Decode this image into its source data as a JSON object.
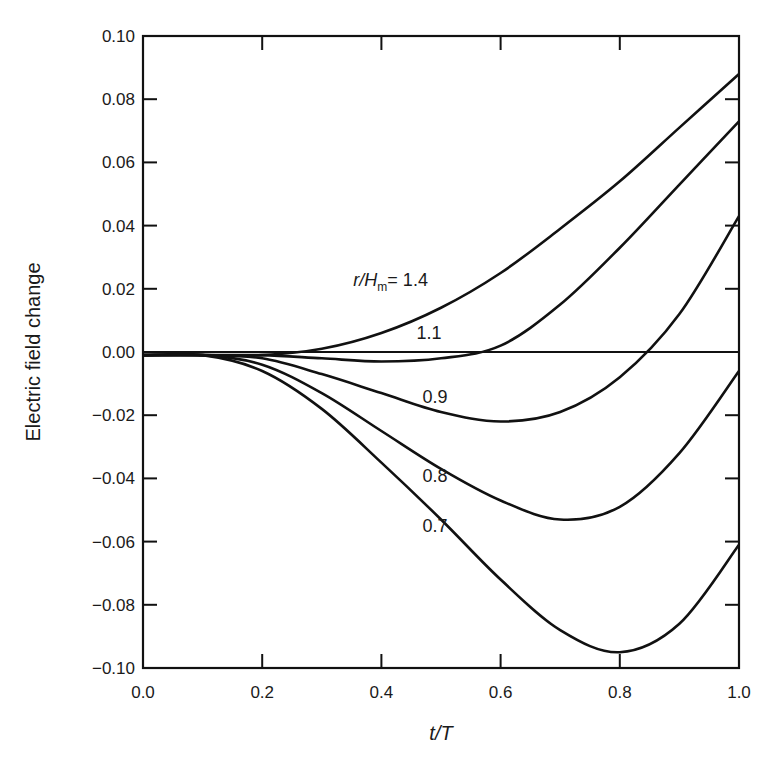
{
  "chart_data": {
    "type": "line",
    "title": "",
    "xlabel": "t/T",
    "ylabel": "Electric field change",
    "xlim": [
      0.0,
      1.0
    ],
    "ylim": [
      -0.1,
      0.1
    ],
    "grid": false,
    "legend_position": "inline curve labels",
    "x_ticks": [
      "0.0",
      "0.2",
      "0.4",
      "0.6",
      "0.8",
      "1.0"
    ],
    "y_ticks": [
      "0.10",
      "0.08",
      "0.06",
      "0.04",
      "0.02",
      "0.00",
      "−0.02",
      "−0.04",
      "−0.06",
      "−0.08",
      "−0.10"
    ],
    "reference_line": {
      "y": 0.0,
      "label": "zero line"
    },
    "label_prefix": "r/H",
    "label_subscript": "m",
    "series": [
      {
        "name": "r/Hm = 1.4",
        "label": "= 1.4",
        "x": [
          0.0,
          0.1,
          0.2,
          0.3,
          0.4,
          0.5,
          0.6,
          0.7,
          0.8,
          0.9,
          1.0
        ],
        "values": [
          -0.001,
          -0.001,
          -0.001,
          0.001,
          0.006,
          0.014,
          0.025,
          0.039,
          0.054,
          0.071,
          0.088
        ]
      },
      {
        "name": "r/Hm = 1.1",
        "label": "1.1",
        "x": [
          0.0,
          0.1,
          0.2,
          0.3,
          0.4,
          0.5,
          0.6,
          0.7,
          0.8,
          0.9,
          1.0
        ],
        "values": [
          -0.001,
          -0.001,
          -0.001,
          -0.002,
          -0.003,
          -0.002,
          0.002,
          0.015,
          0.033,
          0.053,
          0.073
        ]
      },
      {
        "name": "r/Hm = 0.9",
        "label": "0.9",
        "x": [
          0.0,
          0.1,
          0.2,
          0.3,
          0.4,
          0.5,
          0.6,
          0.7,
          0.8,
          0.9,
          1.0
        ],
        "values": [
          -0.001,
          -0.001,
          -0.002,
          -0.007,
          -0.013,
          -0.019,
          -0.022,
          -0.019,
          -0.008,
          0.012,
          0.043
        ]
      },
      {
        "name": "r/Hm = 0.8",
        "label": "0.8",
        "x": [
          0.0,
          0.1,
          0.2,
          0.3,
          0.4,
          0.5,
          0.6,
          0.7,
          0.8,
          0.9,
          1.0
        ],
        "values": [
          -0.001,
          -0.001,
          -0.004,
          -0.013,
          -0.025,
          -0.037,
          -0.047,
          -0.053,
          -0.049,
          -0.032,
          -0.006
        ]
      },
      {
        "name": "r/Hm = 0.7",
        "label": "0.7",
        "x": [
          0.0,
          0.1,
          0.2,
          0.3,
          0.4,
          0.5,
          0.6,
          0.7,
          0.8,
          0.9,
          1.0
        ],
        "values": [
          -0.001,
          -0.001,
          -0.006,
          -0.018,
          -0.035,
          -0.053,
          -0.072,
          -0.088,
          -0.095,
          -0.086,
          -0.061
        ]
      }
    ],
    "label_positions": [
      {
        "series": 0,
        "t": 0.41,
        "v": 0.021
      },
      {
        "series": 1,
        "t": 0.48,
        "v": 0.004
      },
      {
        "series": 2,
        "t": 0.49,
        "v": -0.016
      },
      {
        "series": 3,
        "t": 0.49,
        "v": -0.041
      },
      {
        "series": 4,
        "t": 0.49,
        "v": -0.057
      }
    ],
    "colors": {
      "line": "#111111",
      "text": "#1a1a1a",
      "background": "#ffffff"
    }
  }
}
